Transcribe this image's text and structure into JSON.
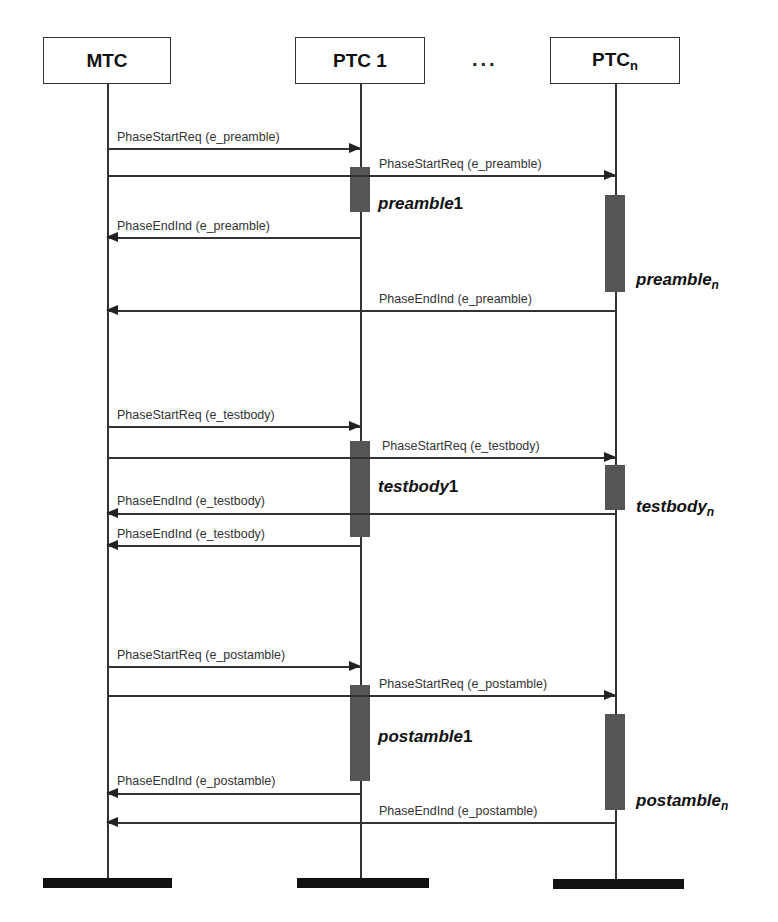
{
  "diagram": {
    "type": "sequence",
    "participants": [
      {
        "id": "mtc",
        "label": "MTC",
        "subscript": ""
      },
      {
        "id": "ptc1",
        "label": "PTC 1",
        "subscript": ""
      },
      {
        "id": "ptcn",
        "label": "PTC",
        "subscript": "n"
      }
    ],
    "ellipsis": "...",
    "messages": [
      {
        "label": "PhaseStartReq (e_preamble)",
        "from": "MTC",
        "to": "PTC 1"
      },
      {
        "label": "PhaseStartReq (e_preamble)",
        "from": "MTC",
        "to": "PTCn"
      },
      {
        "label": "PhaseEndInd (e_preamble)",
        "from": "PTC 1",
        "to": "MTC"
      },
      {
        "label": "PhaseEndInd (e_preamble)",
        "from": "PTCn",
        "to": "MTC"
      },
      {
        "label": "PhaseStartReq (e_testbody)",
        "from": "MTC",
        "to": "PTC 1"
      },
      {
        "label": "PhaseStartReq (e_testbody)",
        "from": "MTC",
        "to": "PTCn"
      },
      {
        "label": "PhaseEndInd (e_testbody)",
        "from": "PTCn",
        "to": "MTC"
      },
      {
        "label": "PhaseEndInd (e_testbody)",
        "from": "PTC 1",
        "to": "MTC"
      },
      {
        "label": "PhaseStartReq (e_postamble)",
        "from": "MTC",
        "to": "PTC 1"
      },
      {
        "label": "PhaseStartReq (e_postamble)",
        "from": "MTC",
        "to": "PTCn"
      },
      {
        "label": "PhaseEndInd (e_postamble)",
        "from": "PTC 1",
        "to": "MTC"
      },
      {
        "label": "PhaseEndInd (e_postamble)",
        "from": "PTCn",
        "to": "MTC"
      }
    ],
    "phases": [
      {
        "name": "preamble",
        "suffix": "1"
      },
      {
        "name": "preamble",
        "suffix": "n"
      },
      {
        "name": "testbody",
        "suffix": "1"
      },
      {
        "name": "testbody",
        "suffix": "n"
      },
      {
        "name": "postamble",
        "suffix": "1"
      },
      {
        "name": "postamble",
        "suffix": "n"
      }
    ]
  }
}
